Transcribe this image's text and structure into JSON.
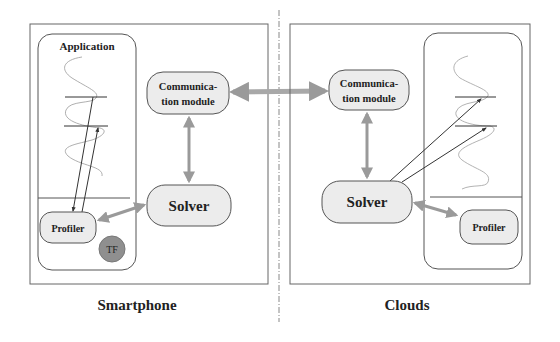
{
  "diagram": {
    "left_panel": {
      "caption": "Smartphone",
      "application_label": "Application",
      "communication_module": [
        "Communica-",
        "tion module"
      ],
      "solver": "Solver",
      "profiler": "Profiler",
      "tf_badge": "TF"
    },
    "right_panel": {
      "caption": "Clouds",
      "communication_module": [
        "Communica-",
        "tion module"
      ],
      "solver": "Solver",
      "profiler": "Profiler"
    },
    "edges": [
      {
        "from": "left.communication_module",
        "to": "right.communication_module",
        "type": "bidirectional"
      },
      {
        "from": "left.communication_module",
        "to": "left.solver",
        "type": "bidirectional"
      },
      {
        "from": "left.solver",
        "to": "left.profiler",
        "type": "bidirectional"
      },
      {
        "from": "right.communication_module",
        "to": "right.solver",
        "type": "bidirectional"
      },
      {
        "from": "right.solver",
        "to": "right.profiler",
        "type": "bidirectional"
      },
      {
        "from": "left.application.probe_points",
        "to": "left.profiler",
        "type": "directed"
      },
      {
        "from": "right.solver",
        "to": "right.application.probe_points",
        "type": "directed"
      }
    ],
    "colors": {
      "node_fill": "#ececec",
      "node_stroke": "#555555",
      "arrow": "#9a9a9a",
      "tf_fill": "#8f8f8f",
      "border": "#666666"
    }
  }
}
